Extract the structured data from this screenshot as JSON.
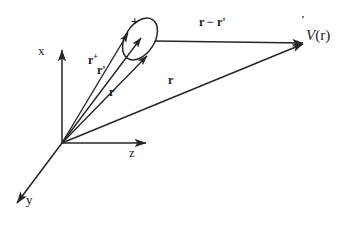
{
  "figure": {
    "kind": "physics-vector-diagram",
    "background_color": "#ffffff",
    "stroke_color": "#262626",
    "text_color": "#1a1a1a",
    "width": 345,
    "height": 226
  },
  "axes": {
    "origin_label": "",
    "items": [
      {
        "name": "x",
        "label": "x",
        "direction": "up",
        "label_x": 40,
        "label_y": 50
      },
      {
        "name": "z",
        "label": "z",
        "direction": "right",
        "label_x": 131,
        "label_y": 152
      },
      {
        "name": "y",
        "label": "y",
        "direction": "down-left",
        "label_x": 27,
        "label_y": 199
      }
    ]
  },
  "source": {
    "shape": "ellipse",
    "charge_symbol": "+",
    "charge_symbol_x": 133,
    "charge_symbol_y": 20,
    "center_x": 140,
    "center_y": 39,
    "rx": 23,
    "ry": 14,
    "rotation_deg": -57
  },
  "vectors": [
    {
      "id": "r-plus",
      "label": "r",
      "superscript": "+",
      "prime": "",
      "label_x": 89,
      "label_y": 58,
      "from": "origin",
      "to": "source-upper-edge"
    },
    {
      "id": "r-prime",
      "label": "r",
      "superscript": "",
      "prime": "'",
      "label_x": 98,
      "label_y": 69,
      "from": "origin",
      "to": "source-center"
    },
    {
      "id": "r-inner",
      "label": "r",
      "superscript": "",
      "prime": "",
      "label_x": 110,
      "label_y": 91,
      "from": "origin",
      "to": "source-lower-edge"
    },
    {
      "id": "r-main",
      "label": "r",
      "superscript": "",
      "prime": "",
      "label_x": 169,
      "label_y": 79,
      "from": "origin",
      "to": "field-point"
    },
    {
      "id": "r-minus-r-prime",
      "label": "r − r",
      "superscript": "",
      "prime": "'",
      "label_x": 200,
      "label_y": 21,
      "from": "source",
      "to": "field-point"
    }
  ],
  "field_point": {
    "label_symbol": "V",
    "label_arg": "(r)",
    "label_x": 306,
    "label_y": 34,
    "x": 302,
    "y": 43
  },
  "stray_mark": {
    "name": "stray-dot",
    "x": 303,
    "y": 17,
    "radius": 1.1
  }
}
